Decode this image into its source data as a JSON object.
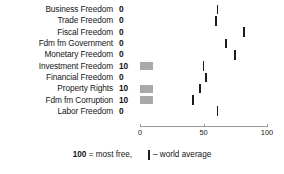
{
  "chart_data": {
    "type": "bar",
    "title": "",
    "xlabel": "",
    "ylabel": "",
    "xlim": [
      0,
      100
    ],
    "grid": false,
    "orientation": "horizontal",
    "categories": [
      "Business Freedom",
      "Trade Freedom",
      "Fiscal Freedom",
      "Fdm fm Government",
      "Monetary Freedom",
      "Investment Freedom",
      "Financial Freedom",
      "Property Rights",
      "Fdm fm Corruption",
      "Labor Freedom"
    ],
    "series": [
      {
        "name": "score",
        "values": [
          0,
          0,
          0,
          0,
          0,
          10,
          0,
          10,
          10,
          0
        ]
      },
      {
        "name": "world average",
        "values": [
          61,
          60,
          82,
          68,
          75,
          50,
          52,
          47,
          42,
          61
        ]
      }
    ],
    "xticks": [
      0,
      50,
      100
    ],
    "xticklabels": [
      "0",
      "50",
      "100"
    ],
    "legend": {
      "position": "bottom",
      "scale_note_value": "100",
      "scale_note_text": " = most free,",
      "average_marker_label": "– world average"
    },
    "colors": {
      "bar": "#a9a9a9",
      "average_marker": "#1c1c1c",
      "axis": "#9a9a9a",
      "text": "#161616",
      "background": "#ffffff"
    }
  }
}
